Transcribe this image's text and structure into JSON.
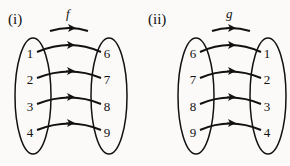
{
  "diagrams": [
    {
      "label": "(i)",
      "function_name": "f",
      "domain": [
        "1",
        "2",
        "3",
        "4"
      ],
      "codomain": [
        "6",
        "7",
        "8",
        "9"
      ],
      "mapping": [
        [
          "1",
          "6"
        ],
        [
          "2",
          "7"
        ],
        [
          "3",
          "8"
        ],
        [
          "4",
          "9"
        ]
      ]
    },
    {
      "label": "(ii)",
      "function_name": "g",
      "domain": [
        "6",
        "7",
        "8",
        "9"
      ],
      "codomain": [
        "1",
        "2",
        "3",
        "4"
      ],
      "mapping": [
        [
          "6",
          "1"
        ],
        [
          "7",
          "2"
        ],
        [
          "8",
          "3"
        ],
        [
          "9",
          "4"
        ]
      ]
    }
  ],
  "colors": {
    "ink": "#111111",
    "background": "#fbfaf8"
  }
}
